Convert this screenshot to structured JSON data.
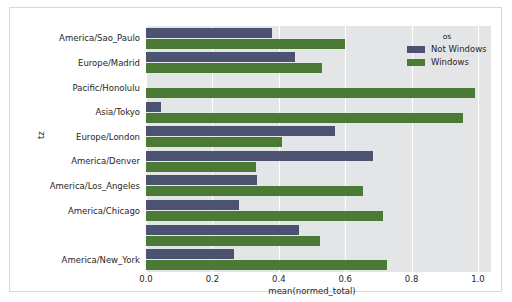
{
  "chart_data": {
    "type": "bar",
    "orientation": "horizontal",
    "title": "",
    "xlabel": "mean(normed_total)",
    "ylabel": "tz",
    "xlim": [
      0.0,
      1.0
    ],
    "xticks": [
      "0.0",
      "0.2",
      "0.4",
      "0.6",
      "0.8",
      "1.0"
    ],
    "xtick_values": [
      0.0,
      0.2,
      0.4,
      0.6,
      0.8,
      1.0
    ],
    "grid": "vertical-white",
    "categories": [
      "America/Sao_Paulo",
      "Europe/Madrid",
      "Pacific/Honolulu",
      "Asia/Tokyo",
      "Europe/London",
      "America/Denver",
      "America/Los_Angeles",
      "America/Chicago",
      "",
      "America/New_York"
    ],
    "series": [
      {
        "name": "Not Windows",
        "color": "#4c5272",
        "values": [
          0.38,
          0.45,
          0.0,
          0.045,
          0.57,
          0.685,
          0.335,
          0.28,
          0.46,
          0.265
        ]
      },
      {
        "name": "Windows",
        "color": "#4a7a36",
        "values": [
          0.6,
          0.53,
          0.99,
          0.955,
          0.41,
          0.33,
          0.655,
          0.715,
          0.525,
          0.725
        ]
      }
    ],
    "legend": {
      "title": "os",
      "position": "top-right",
      "entries": [
        {
          "label": "Not Windows",
          "color": "#4c5272"
        },
        {
          "label": "Windows",
          "color": "#4a7a36"
        }
      ]
    },
    "plot_background": "#e4e5e7",
    "figure_background": "#ffffff"
  }
}
